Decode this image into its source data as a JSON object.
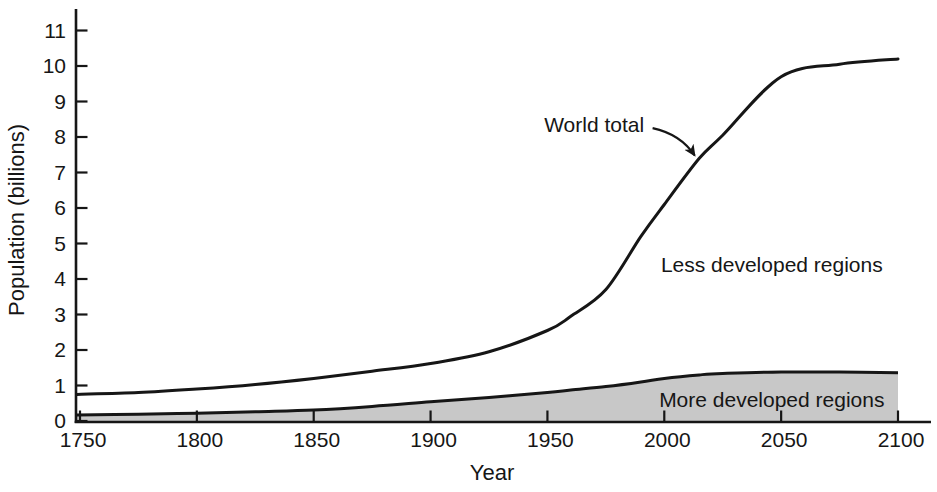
{
  "figure": {
    "background": "#ffffff",
    "ink": "#161616",
    "area_fill": "#c8c8c8"
  },
  "chart_data": {
    "type": "area",
    "title": "",
    "xlabel": "Year",
    "ylabel": "Population (billions)",
    "xlim": [
      1750,
      2100
    ],
    "ylim": [
      0,
      11
    ],
    "x_ticks": [
      1750,
      1800,
      1850,
      1900,
      1950,
      2000,
      2050,
      2100
    ],
    "y_ticks": [
      0,
      1,
      2,
      3,
      4,
      5,
      6,
      7,
      8,
      9,
      10,
      11
    ],
    "grid": false,
    "legend": "none",
    "x": [
      1750,
      1775,
      1800,
      1825,
      1850,
      1875,
      1900,
      1925,
      1950,
      1960,
      1975,
      1990,
      2000,
      2015,
      2025,
      2050,
      2075,
      2100
    ],
    "series": [
      {
        "name": "World total",
        "type": "line",
        "color": "#161616",
        "values": [
          0.75,
          0.8,
          0.9,
          1.03,
          1.2,
          1.4,
          1.62,
          1.95,
          2.55,
          2.95,
          3.7,
          5.2,
          6.1,
          7.4,
          8.05,
          9.7,
          10.05,
          10.2
        ]
      },
      {
        "name": "More developed regions",
        "type": "area",
        "color": "#161616",
        "fill": "#c8c8c8",
        "values": [
          0.17,
          0.19,
          0.22,
          0.26,
          0.31,
          0.41,
          0.54,
          0.66,
          0.8,
          0.87,
          0.97,
          1.1,
          1.2,
          1.3,
          1.34,
          1.38,
          1.38,
          1.36
        ]
      }
    ],
    "annotations": [
      {
        "id": "world-total-label",
        "text": "World total",
        "year": 1970,
        "value": 8.35,
        "arrow": {
          "from": {
            "year": 1995,
            "value": 8.25
          },
          "control": {
            "year": 2007,
            "value": 8.08
          },
          "to": {
            "year": 2013,
            "value": 7.48
          }
        }
      },
      {
        "id": "less-developed-label",
        "text": "Less developed regions",
        "year": 2046,
        "value": 4.4
      },
      {
        "id": "more-developed-label",
        "text": "More developed regions",
        "year": 2046,
        "value": 0.6
      }
    ]
  }
}
